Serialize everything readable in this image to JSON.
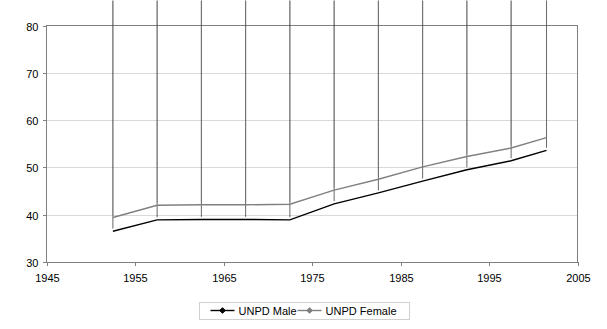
{
  "chart_data": {
    "type": "line",
    "title": "",
    "xlabel": "",
    "ylabel": "",
    "xlim": [
      1945,
      2005
    ],
    "ylim": [
      30,
      80
    ],
    "xticks": [
      1945,
      1955,
      1965,
      1975,
      1985,
      1995,
      2005
    ],
    "yticks": [
      30,
      40,
      50,
      60,
      70,
      80
    ],
    "grid": "horizontal",
    "legend_position": "bottom",
    "x": [
      1952.5,
      1957.5,
      1962.5,
      1967.5,
      1972.5,
      1977.5,
      1982.5,
      1987.5,
      1992.5,
      1997.5,
      2001.5
    ],
    "series": [
      {
        "name": "UNPD Male",
        "color": "#000000",
        "marker": "diamond",
        "values": [
          36.5,
          38.9,
          39.0,
          39.0,
          38.9,
          42.3,
          44.6,
          47.1,
          49.5,
          51.4,
          53.6
        ]
      },
      {
        "name": "UNPD Female",
        "color": "#808080",
        "marker": "diamond",
        "values": [
          39.4,
          42.0,
          42.1,
          42.1,
          42.2,
          45.2,
          47.5,
          50.1,
          52.3,
          54.1,
          56.3
        ]
      }
    ]
  },
  "axes": {
    "y_tick_labels": [
      "80",
      "70",
      "60",
      "50",
      "40",
      "30"
    ],
    "x_tick_labels": [
      "1945",
      "1955",
      "1965",
      "1975",
      "1985",
      "1995",
      "2005"
    ]
  },
  "legend": {
    "items": [
      {
        "label": "UNPD Male",
        "color": "#000000"
      },
      {
        "label": "UNPD Female",
        "color": "#808080"
      }
    ]
  },
  "colors": {
    "male": "#000000",
    "female": "#808080",
    "grid": "#d9d9d9",
    "frame": "#808080",
    "background": "#ffffff"
  }
}
